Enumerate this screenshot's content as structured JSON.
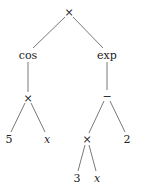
{
  "diagram": {
    "type": "expression-tree",
    "colors": {
      "edge": "#555555",
      "text": "#222222",
      "background": "#ffffff"
    },
    "nodes": [
      {
        "id": "n0",
        "label": "×",
        "x": 69,
        "y": 12,
        "italic": false
      },
      {
        "id": "n1",
        "label": "cos",
        "x": 28,
        "y": 55,
        "italic": false
      },
      {
        "id": "n2",
        "label": "exp",
        "x": 107,
        "y": 55,
        "italic": false
      },
      {
        "id": "n3",
        "label": "×",
        "x": 28,
        "y": 98,
        "italic": false
      },
      {
        "id": "n4",
        "label": "−",
        "x": 107,
        "y": 96,
        "italic": false
      },
      {
        "id": "n5",
        "label": "5",
        "x": 9,
        "y": 139,
        "italic": false
      },
      {
        "id": "n6",
        "label": "x",
        "x": 47,
        "y": 139,
        "italic": true
      },
      {
        "id": "n7",
        "label": "×",
        "x": 87,
        "y": 139,
        "italic": false
      },
      {
        "id": "n8",
        "label": "2",
        "x": 127,
        "y": 139,
        "italic": false
      },
      {
        "id": "n9",
        "label": "3",
        "x": 77,
        "y": 178,
        "italic": false
      },
      {
        "id": "n10",
        "label": "x",
        "x": 97,
        "y": 178,
        "italic": true
      }
    ],
    "edges": [
      {
        "x1": 65,
        "y1": 17,
        "x2": 33,
        "y2": 48
      },
      {
        "x1": 73,
        "y1": 17,
        "x2": 103,
        "y2": 48
      },
      {
        "x1": 28,
        "y1": 62,
        "x2": 28,
        "y2": 92
      },
      {
        "x1": 107,
        "y1": 62,
        "x2": 107,
        "y2": 90
      },
      {
        "x1": 25,
        "y1": 103,
        "x2": 11,
        "y2": 132
      },
      {
        "x1": 31,
        "y1": 103,
        "x2": 45,
        "y2": 132
      },
      {
        "x1": 104,
        "y1": 101,
        "x2": 89,
        "y2": 133
      },
      {
        "x1": 110,
        "y1": 101,
        "x2": 125,
        "y2": 132
      },
      {
        "x1": 85,
        "y1": 145,
        "x2": 78,
        "y2": 171
      },
      {
        "x1": 89,
        "y1": 145,
        "x2": 96,
        "y2": 171
      }
    ]
  }
}
